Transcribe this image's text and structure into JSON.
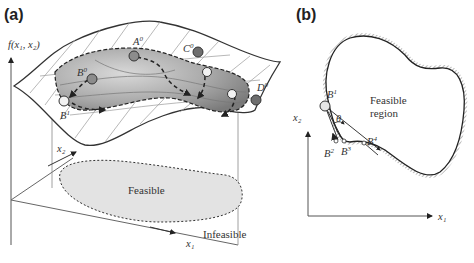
{
  "panels": {
    "a": {
      "label": "(a)",
      "axes": {
        "y": "f(x₁, x₂)",
        "x1": "x₁",
        "x2": "x₂"
      },
      "regions": {
        "feasible": "Feasible",
        "infeasible": "Infeasible"
      },
      "points": [
        {
          "name": "A",
          "sup": "0",
          "fill": "#8c8c8c"
        },
        {
          "name": "B",
          "sup": "0",
          "fill": "#8c8c8c"
        },
        {
          "name": "B",
          "sup": "1",
          "fill": "#f2f2f2"
        },
        {
          "name": "C",
          "sup": "0",
          "fill": "#6e6e6e"
        },
        {
          "name": "D",
          "sup": "0",
          "fill": "#6e6e6e"
        }
      ]
    },
    "b": {
      "label": "(b)",
      "axes": {
        "x1": "x₁",
        "x2": "x₂"
      },
      "region_label_line1": "Feasible",
      "region_label_line2": "region",
      "angle_symbol": "θ",
      "points": [
        {
          "name": "B",
          "sup": "1"
        },
        {
          "name": "B",
          "sup": "2"
        },
        {
          "name": "B",
          "sup": "3"
        },
        {
          "name": "B",
          "sup": "4"
        }
      ]
    }
  },
  "colors": {
    "line": "#333333",
    "grid": "#9a9a9a",
    "feasible_fill": "#e6e6e6",
    "hatch": "#9a9a9a",
    "point_dark": "#6e6e6e",
    "point_light": "#f2f2f2"
  }
}
